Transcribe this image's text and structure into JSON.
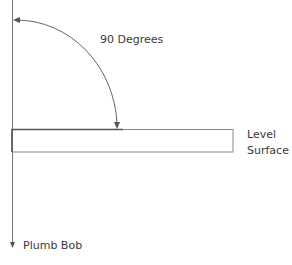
{
  "diagram": {
    "angle_label": "90 Degrees",
    "surface_label_line1": "Level",
    "surface_label_line2": "Surface",
    "plumb_label": "Plumb Bob",
    "colors": {
      "line": "#555555",
      "text": "#3a3a3a",
      "background": "#ffffff"
    }
  }
}
